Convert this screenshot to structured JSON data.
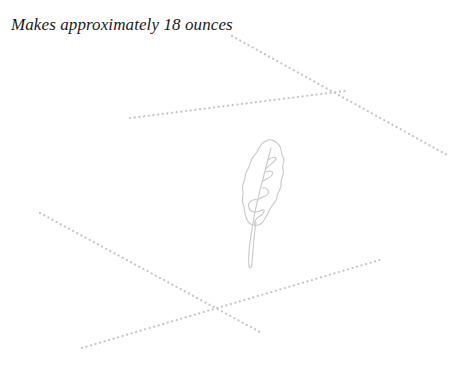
{
  "page": {
    "caption": "Makes approximately 18 ounces"
  },
  "illustration": {
    "subject": "leaf-sketch",
    "line_color": "#c4c4c4",
    "dotted_lines": [
      {
        "x1": 232,
        "y1": 36,
        "x2": 449,
        "y2": 156
      },
      {
        "x1": 130,
        "y1": 118,
        "x2": 345,
        "y2": 91
      },
      {
        "x1": 40,
        "y1": 213,
        "x2": 260,
        "y2": 332
      },
      {
        "x1": 82,
        "y1": 348,
        "x2": 383,
        "y2": 259
      }
    ]
  }
}
